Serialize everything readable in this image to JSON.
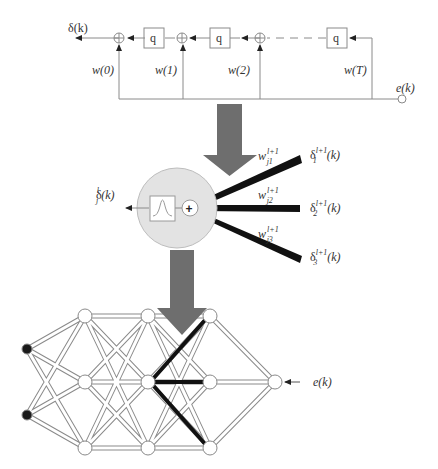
{
  "fir_filter": {
    "output_label": "δ(k)",
    "delay_label": "q",
    "weights": [
      "w(0)",
      "w(1)",
      "w(2)",
      "w(T)"
    ],
    "input_label": "e(k)"
  },
  "neuron": {
    "output_base": "δ",
    "output_sub": "j",
    "output_sup": "l",
    "output_arg": "(k)",
    "weights": [
      {
        "base": "w",
        "sub": "j1",
        "sup": "l+1"
      },
      {
        "base": "w",
        "sub": "j2",
        "sup": "l+1"
      },
      {
        "base": "w",
        "sub": "j3",
        "sup": "l+1"
      }
    ],
    "deltas": [
      {
        "base": "δ",
        "sub": "1",
        "sup": "l+1",
        "arg": "(k)"
      },
      {
        "base": "δ",
        "sub": "2",
        "sup": "l+1",
        "arg": "(k)"
      },
      {
        "base": "δ",
        "sub": "3",
        "sup": "l+1",
        "arg": "(k)"
      }
    ]
  },
  "network": {
    "error_label": "e(k)"
  },
  "colors": {
    "line": "#8a8a8a",
    "arrow_fill": "#6e6e6e",
    "neuron_fill": "#e3e3e3",
    "thick_edge": "#111111",
    "input_node": "#1a1a1a"
  }
}
